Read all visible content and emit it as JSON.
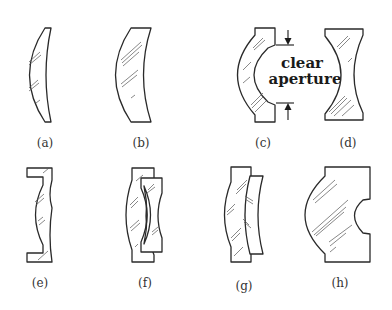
{
  "figure": {
    "panels": [
      {
        "id": "a",
        "label": "(a)",
        "description": "meniscus lens, thin"
      },
      {
        "id": "b",
        "label": "(b)",
        "description": "meniscus lens, thick"
      },
      {
        "id": "c",
        "label": "(c)",
        "description": "meniscus lens with stepped edges showing clear aperture"
      },
      {
        "id": "d",
        "label": "(d)",
        "description": "biconcave lens with flat rims"
      },
      {
        "id": "e",
        "label": "(e)",
        "description": "lens with flanged mounting rims"
      },
      {
        "id": "f",
        "label": "(f)",
        "description": "cemented doublet, convex + concave"
      },
      {
        "id": "g",
        "label": "(g)",
        "description": "air-spaced meniscus doublet"
      },
      {
        "id": "h",
        "label": "(h)",
        "description": "thick lens, convex front and concave back"
      }
    ],
    "annotation": {
      "line1": "clear",
      "line2": "aperture",
      "icons": [
        "arrow-down-icon",
        "arrow-up-icon"
      ]
    },
    "colors": {
      "stroke": "#2a2a2a",
      "label": "#333333",
      "background": "#ffffff"
    }
  }
}
